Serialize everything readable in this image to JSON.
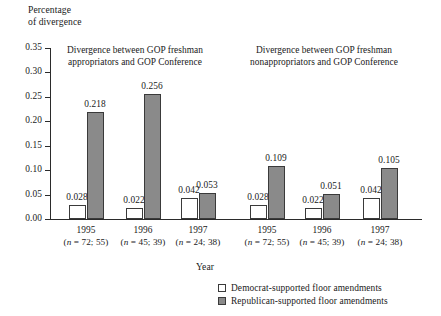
{
  "chart_data": {
    "type": "bar",
    "title": "",
    "ylabel": "Percentage\nof divergence",
    "xlabel": "Year",
    "ylim": [
      0.0,
      0.35
    ],
    "ytick_labels": [
      "0.00",
      "0.05",
      "0.10",
      "0.15",
      "0.20",
      "0.25",
      "0.30",
      "0.35"
    ],
    "ytick_values": [
      0.0,
      0.05,
      0.1,
      0.15,
      0.2,
      0.25,
      0.3,
      0.35
    ],
    "grid": false,
    "legend_position": "bottom-right",
    "panels": [
      {
        "title": "Divergence between GOP freshman\nappropriators and GOP Conference",
        "categories": [
          "1995",
          "1996",
          "1997"
        ],
        "category_notes": [
          "(n = 72; 55)",
          "(n = 45; 39)",
          "(n = 24; 38)"
        ],
        "series": [
          {
            "name": "Democrat-supported floor amendments",
            "values": [
              0.028,
              0.022,
              0.042
            ],
            "labels": [
              "0.028",
              "0.022",
              "0.042"
            ]
          },
          {
            "name": "Republican-supported floor amendments",
            "values": [
              0.218,
              0.256,
              0.053
            ],
            "labels": [
              "0.218",
              "0.256",
              "0.053"
            ]
          }
        ]
      },
      {
        "title": "Divergence between GOP freshman\nnonappropriators and GOP Conference",
        "categories": [
          "1995",
          "1996",
          "1997"
        ],
        "category_notes": [
          "(n = 72; 55)",
          "(n = 45; 39)",
          "(n = 24; 38)"
        ],
        "series": [
          {
            "name": "Democrat-supported floor amendments",
            "values": [
              0.028,
              0.022,
              0.042
            ],
            "labels": [
              "0.028",
              "0.022",
              "0.042"
            ]
          },
          {
            "name": "Republican-supported floor amendments",
            "values": [
              0.109,
              0.051,
              0.105
            ],
            "labels": [
              "0.109",
              "0.051",
              "0.105"
            ]
          }
        ]
      }
    ],
    "legend": [
      {
        "label": "Democrat-supported floor amendments",
        "swatch": "dem",
        "color": "#ffffff"
      },
      {
        "label": "Republican-supported floor amendments",
        "swatch": "rep",
        "color": "#8a8a8a"
      }
    ],
    "colors": {
      "democrat": "#ffffff",
      "republican": "#8a8a8a",
      "axis": "#2b2b2b",
      "text": "#1a1a1a"
    }
  }
}
